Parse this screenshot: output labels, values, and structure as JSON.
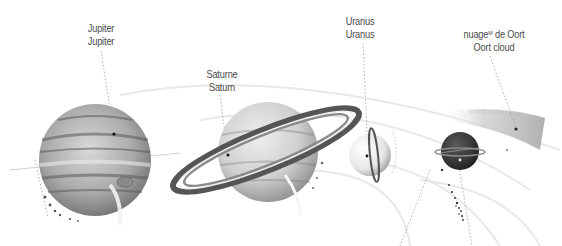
{
  "labels": {
    "jupiter": {
      "fr": "Jupiter",
      "en": "Jupiter"
    },
    "saturn": {
      "fr": "Saturne",
      "en": "Saturn"
    },
    "uranus": {
      "fr": "Uranus",
      "en": "Uranus"
    },
    "oort": {
      "fr_prefix": "nuage",
      "fr_sup": "M",
      "fr_suffix": "de Oort",
      "en": "Oort cloud"
    }
  },
  "colors": {
    "background": "#ffffff",
    "text": "#4a4a4a",
    "leader_line": "#9a9a9a",
    "jupiter_base": "#b8b8b8",
    "saturn_base": "#d2d2d2",
    "uranus_base": "#efefef",
    "neptune_base": "#3a3a3a",
    "oort_cloud": "#c8c8c8"
  },
  "bodies": [
    "Jupiter",
    "Saturn",
    "Uranus",
    "Neptune",
    "Oort cloud"
  ]
}
